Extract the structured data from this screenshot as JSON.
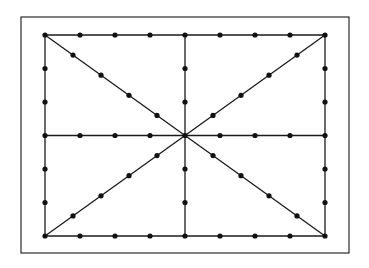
{
  "diagram": {
    "title": "",
    "colors": {
      "background": "#ffffff",
      "frame": "#2a2a2a",
      "line": "#1a1a1a",
      "dot": "#111111"
    },
    "frame": {
      "x1": 21,
      "y1": 17,
      "x2": 349,
      "y2": 253
    },
    "rectangle": {
      "x1": 45,
      "y1": 35,
      "x2": 325,
      "y2": 236
    },
    "grid": {
      "horizontal_divisions": 8,
      "vertical_divisions": 6,
      "diagonal_divisions_per_half": 5
    },
    "lines": [
      {
        "name": "top-edge",
        "from": [
          45,
          35
        ],
        "to": [
          325,
          35
        ]
      },
      {
        "name": "bottom-edge",
        "from": [
          45,
          236
        ],
        "to": [
          325,
          236
        ]
      },
      {
        "name": "left-edge",
        "from": [
          45,
          35
        ],
        "to": [
          45,
          236
        ]
      },
      {
        "name": "right-edge",
        "from": [
          325,
          35
        ],
        "to": [
          325,
          236
        ]
      },
      {
        "name": "horizontal-midline",
        "from": [
          45,
          135.5
        ],
        "to": [
          325,
          135.5
        ]
      },
      {
        "name": "vertical-midline",
        "from": [
          185,
          35
        ],
        "to": [
          185,
          236
        ]
      },
      {
        "name": "diagonal-tl-br",
        "from": [
          45,
          35
        ],
        "to": [
          325,
          236
        ]
      },
      {
        "name": "diagonal-tr-bl",
        "from": [
          325,
          35
        ],
        "to": [
          45,
          236
        ]
      }
    ],
    "dot_radius": 2.6,
    "line_width": 1.3,
    "frame_width": 1.2
  }
}
